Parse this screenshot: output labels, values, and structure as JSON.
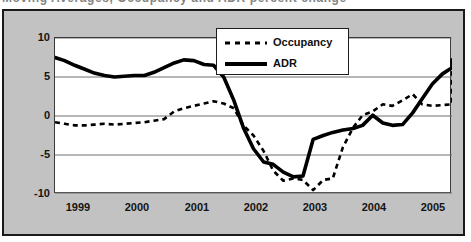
{
  "caption": {
    "text": "Moving Averages, Occupancy and ADR percent change"
  },
  "colors": {
    "frame_background": "#c2c2c2",
    "plot_background": "#ffffff",
    "axis": "#1a1a1a",
    "gridline": "#808080",
    "series_adr": "#000000",
    "series_occupancy": "#000000"
  },
  "legend": {
    "position": "top-center",
    "entries": [
      {
        "label": "Occupancy",
        "style": "dashed",
        "icon": "dashed-line-swatch"
      },
      {
        "label": "ADR",
        "style": "solid",
        "icon": "solid-line-swatch"
      }
    ]
  },
  "chart_data": {
    "type": "line",
    "title": "",
    "subtitle": "",
    "xlabel": "",
    "ylabel": "",
    "grid": true,
    "legend_position": "top-center",
    "xlim": [
      1998.92,
      2005.58
    ],
    "ylim": [
      -10,
      10
    ],
    "yticks": [
      10,
      5,
      0,
      -5,
      -10
    ],
    "ytick_labels": [
      "10",
      "5",
      "0",
      "-5",
      "-10"
    ],
    "xticks": [
      1999,
      2000,
      2001,
      2002,
      2003,
      2004,
      2005
    ],
    "xtick_labels": [
      "1999",
      "2000",
      "2001",
      "2002",
      "2003",
      "2004",
      "2005"
    ],
    "x": [
      1998.92,
      1999.08,
      1999.25,
      1999.42,
      1999.58,
      1999.75,
      1999.92,
      2000.08,
      2000.25,
      2000.42,
      2000.58,
      2000.75,
      2000.92,
      2001.08,
      2001.25,
      2001.42,
      2001.58,
      2001.75,
      2001.92,
      2002.08,
      2002.25,
      2002.42,
      2002.58,
      2002.75,
      2002.92,
      2003.08,
      2003.25,
      2003.42,
      2003.58,
      2003.75,
      2003.92,
      2004.08,
      2004.25,
      2004.42,
      2004.58,
      2004.75,
      2004.92,
      2005.08,
      2005.25,
      2005.42,
      2005.58
    ],
    "series": [
      {
        "name": "ADR",
        "style": "solid",
        "values": [
          7.5,
          7.1,
          6.5,
          6.0,
          5.5,
          5.2,
          5.0,
          5.1,
          5.2,
          5.2,
          5.6,
          6.2,
          6.8,
          7.2,
          7.1,
          6.6,
          6.5,
          5.0,
          2.0,
          -1.5,
          -4.2,
          -5.9,
          -6.2,
          -7.2,
          -7.8,
          -7.7,
          -3.0,
          -2.5,
          -2.1,
          -1.8,
          -1.6,
          -1.2,
          0.1,
          -0.9,
          -1.2,
          -1.1,
          0.4,
          2.2,
          4.1,
          5.4,
          6.2
        ],
        "final_values": [
          6.4,
          7.0,
          6.6,
          7.2
        ]
      },
      {
        "name": "Occupancy",
        "style": "dashed",
        "values": [
          -0.8,
          -1.0,
          -1.2,
          -1.2,
          -1.1,
          -1.0,
          -1.1,
          -1.0,
          -0.9,
          -0.8,
          -0.6,
          -0.4,
          0.6,
          1.0,
          1.3,
          1.6,
          1.9,
          1.6,
          1.0,
          -1.2,
          -2.5,
          -4.5,
          -7.0,
          -8.3,
          -8.0,
          -8.2,
          -9.5,
          -8.2,
          -8.0,
          -4.0,
          -1.5,
          0.1,
          0.6,
          1.5,
          1.3,
          2.0,
          2.8,
          1.5,
          1.3,
          1.4,
          1.5
        ],
        "final_values": [
          3.4,
          4.5,
          4.6,
          4.6,
          5.2,
          5.4,
          5.6,
          4.9
        ]
      }
    ]
  }
}
